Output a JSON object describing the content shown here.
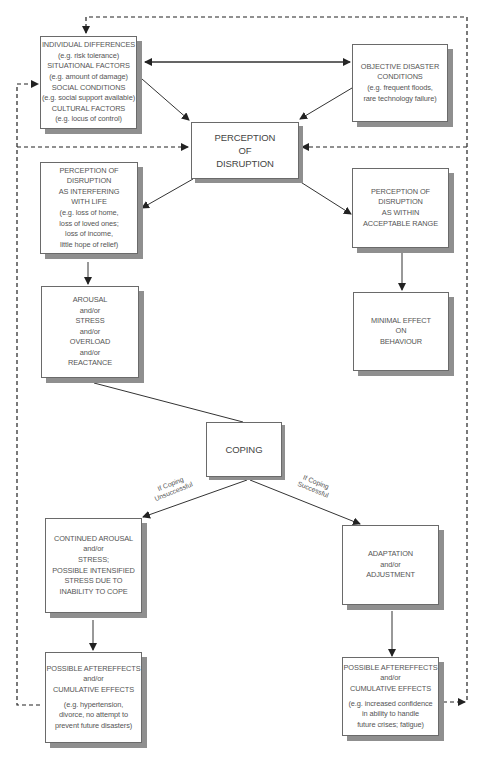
{
  "diagram": {
    "boxes": {
      "individual": {
        "lines": [
          "INDIVIDUAL DIFFERENCES",
          "(e.g. risk tolerance)",
          "SITUATIONAL FACTORS",
          "(e.g. amount of damage)",
          "SOCIAL CONDITIONS",
          "(e.g. social support available)",
          "CULTURAL FACTORS",
          "(e.g. locus of control)"
        ]
      },
      "objective": {
        "lines": [
          "OBJECTIVE DISASTER",
          "CONDITIONS",
          "(e.g. frequent floods,",
          "rare technology failure)"
        ]
      },
      "perception": {
        "lines": [
          "PERCEPTION",
          "OF",
          "DISRUPTION"
        ]
      },
      "interfering": {
        "lines": [
          "PERCEPTION OF",
          "DISRUPTION",
          "AS INTERFERING",
          "WITH LIFE",
          "(e.g. loss of home,",
          "loss of loved ones;",
          "loss of income,",
          "little hope of relief)"
        ]
      },
      "acceptable": {
        "lines": [
          "PERCEPTION OF",
          "DISRUPTION",
          "AS WITHIN",
          "ACCEPTABLE RANGE"
        ]
      },
      "arousal": {
        "lines": [
          "AROUSAL",
          "and/or",
          "STRESS",
          "and/or",
          "OVERLOAD",
          "and/or",
          "REACTANCE"
        ]
      },
      "minimal": {
        "lines": [
          "MINIMAL EFFECT",
          "ON",
          "BEHAVIOUR"
        ]
      },
      "coping": {
        "lines": [
          "COPING"
        ]
      },
      "continued": {
        "lines": [
          "CONTINUED AROUSAL",
          "and/or",
          "STRESS;",
          "POSSIBLE INTENSIFIED",
          "STRESS DUE TO",
          "INABILITY TO COPE"
        ]
      },
      "adaptation": {
        "lines": [
          "ADAPTATION",
          "and/or",
          "ADJUSTMENT"
        ]
      },
      "after_left": {
        "lines": [
          "POSSIBLE AFTEREFFECTS",
          "and/or",
          "CUMULATIVE EFFECTS"
        ],
        "example": [
          "(e.g. hypertension,",
          "divorce, no attempt to",
          "prevent future disasters)"
        ]
      },
      "after_right": {
        "lines": [
          "POSSIBLE AFTEREFFECTS",
          "and/or",
          "CUMULATIVE EFFECTS"
        ],
        "example": [
          "(e.g. increased confidence",
          "in ability to handle",
          "future crises; fatigue)"
        ]
      }
    },
    "edge_labels": {
      "unsuccessful": [
        "If Coping",
        "Unsuccessful"
      ],
      "successful": [
        "If Coping",
        "Successful"
      ]
    },
    "colors": {
      "line": "#333333",
      "box_border": "#6a6a6a",
      "shadow": "#8f8f8f",
      "text": "#555555"
    }
  }
}
